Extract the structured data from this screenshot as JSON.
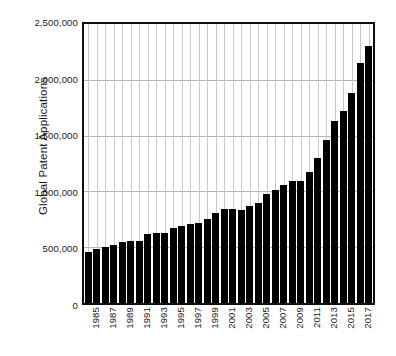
{
  "chart_data": {
    "type": "bar",
    "title": "",
    "subtitle": "",
    "xlabel": "",
    "ylabel": "Global Patent Applications",
    "ylim": [
      0,
      2500000
    ],
    "yticks": [
      0,
      500000,
      1000000,
      1500000,
      2000000,
      2500000
    ],
    "ytick_labels": [
      "0",
      "500,000",
      "1,000,000",
      "1,500,000",
      "2,000,000",
      "2,500,000"
    ],
    "grid": "horizontal-and-vertical",
    "legend": null,
    "bar_color": "#000000",
    "categories": [
      "1985",
      "1986",
      "1987",
      "1988",
      "1989",
      "1990",
      "1991",
      "1992",
      "1993",
      "1994",
      "1995",
      "1996",
      "1997",
      "1998",
      "1999",
      "2000",
      "2001",
      "2002",
      "2003",
      "2004",
      "2005",
      "2006",
      "2007",
      "2008",
      "2009",
      "2010",
      "2011",
      "2012",
      "2013",
      "2014",
      "2015",
      "2016",
      "2017",
      "2018"
    ],
    "xtick_labels": [
      "1985",
      "1987",
      "1989",
      "1991",
      "1993",
      "1995",
      "1997",
      "1999",
      "2001",
      "2003",
      "2005",
      "2007",
      "2009",
      "2011",
      "2013",
      "2015",
      "2017"
    ],
    "values": [
      460000,
      480000,
      505000,
      520000,
      545000,
      555000,
      560000,
      615000,
      625000,
      630000,
      675000,
      690000,
      705000,
      715000,
      750000,
      810000,
      840000,
      840000,
      835000,
      865000,
      900000,
      980000,
      1010000,
      1060000,
      1090000,
      1090000,
      1170000,
      1300000,
      1460000,
      1630000,
      1720000,
      1880000,
      2150000,
      2180000
    ],
    "values_note": "2,300,000 peak at final bar",
    "series": [
      {
        "name": "Global Patent Applications",
        "values": [
          460000,
          480000,
          505000,
          520000,
          545000,
          555000,
          560000,
          615000,
          625000,
          630000,
          675000,
          690000,
          705000,
          715000,
          750000,
          810000,
          840000,
          840000,
          835000,
          865000,
          900000,
          980000,
          1010000,
          1060000,
          1090000,
          1090000,
          1170000,
          1300000,
          1460000,
          1630000,
          1720000,
          1880000,
          2150000,
          2300000
        ]
      }
    ]
  }
}
